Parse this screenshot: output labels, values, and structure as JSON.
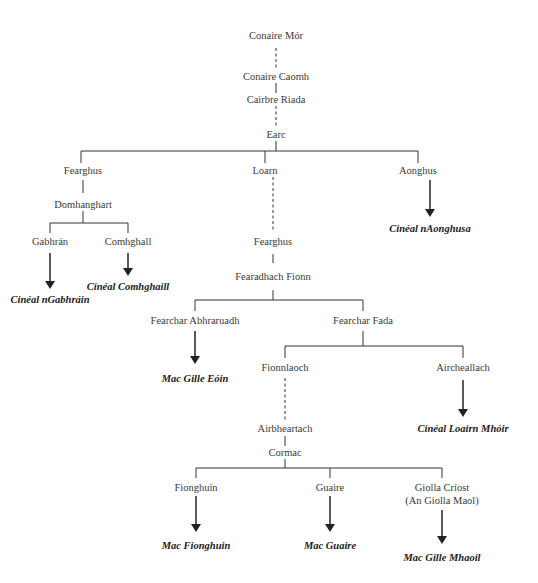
{
  "diagram": {
    "type": "genealogy-tree",
    "people": [
      {
        "id": "conaire_mor",
        "label": "Conaire Mór",
        "x": 276,
        "y": 36
      },
      {
        "id": "conaire_caomh",
        "label": "Conaire Caomh",
        "x": 276,
        "y": 71
      },
      {
        "id": "cairbre_riada",
        "label": "Cairbre Riada",
        "x": 276,
        "y": 94
      },
      {
        "id": "earc",
        "label": "Earc",
        "x": 276,
        "y": 129
      },
      {
        "id": "fearghus_1",
        "label": "Fearghus",
        "x": 83,
        "y": 163
      },
      {
        "id": "loarn",
        "label": "Loarn",
        "x": 265,
        "y": 163
      },
      {
        "id": "aonghus",
        "label": "Aonghus",
        "x": 430,
        "y": 163
      },
      {
        "id": "domhanghart",
        "label": "Domhanghart",
        "x": 83,
        "y": 199
      },
      {
        "id": "gabhran",
        "label": "Gabhrán",
        "x": 50,
        "y": 233
      },
      {
        "id": "comhghall",
        "label": "Comhghall",
        "x": 128,
        "y": 233
      },
      {
        "id": "fearghus_2",
        "label": "Fearghus",
        "x": 273,
        "y": 233
      },
      {
        "id": "fearadhach_fionn",
        "label": "Fearadhach Fionn",
        "x": 273,
        "y": 268
      },
      {
        "id": "fearchar_abhraruadh",
        "label": "Fearchar Abhraruadh",
        "x": 195,
        "y": 317
      },
      {
        "id": "fearchar_fada",
        "label": "Fearchar Fada",
        "x": 363,
        "y": 317
      },
      {
        "id": "fionnlaoch",
        "label": "Fionnlaoch",
        "x": 285,
        "y": 364
      },
      {
        "id": "aircheallach",
        "label": "Aircheallach",
        "x": 463,
        "y": 364
      },
      {
        "id": "airbheartach",
        "label": "Airbheartach",
        "x": 285,
        "y": 424
      },
      {
        "id": "cormac",
        "label": "Cormac",
        "x": 285,
        "y": 447
      },
      {
        "id": "fionghuin",
        "label": "Fionghuin",
        "x": 196,
        "y": 484
      },
      {
        "id": "guaire",
        "label": "Guaire",
        "x": 330,
        "y": 484
      },
      {
        "id": "giolla_criost",
        "label": "Giolla Críost",
        "x": 442,
        "y": 484
      },
      {
        "id": "giolla_criost_alias",
        "label": "(An Giolla Maol)",
        "x": 442,
        "y": 496
      }
    ],
    "clans": [
      {
        "id": "cineal_ngabhrain",
        "label": "Cinéal nGabhráin",
        "x": 50,
        "y": 294
      },
      {
        "id": "cineal_comhghaill",
        "label": "Cinéal Comhghaill",
        "x": 128,
        "y": 281
      },
      {
        "id": "cineal_naonghusa",
        "label": "Cinéal nAonghusa",
        "x": 430,
        "y": 224
      },
      {
        "id": "mac_gille_eoin",
        "label": "Mac Gille Eóin",
        "x": 195,
        "y": 370
      },
      {
        "id": "cineal_loairn_mhoir",
        "label": "Cinéal Loairn Mhóir",
        "x": 463,
        "y": 424
      },
      {
        "id": "mac_fionghuin",
        "label": "Mac Fionghuin",
        "x": 196,
        "y": 540
      },
      {
        "id": "mac_guaire",
        "label": "Mac Guaire",
        "x": 330,
        "y": 540
      },
      {
        "id": "mac_gille_mhaoil",
        "label": "Mac Gille Mhaoil",
        "x": 442,
        "y": 552
      }
    ]
  }
}
